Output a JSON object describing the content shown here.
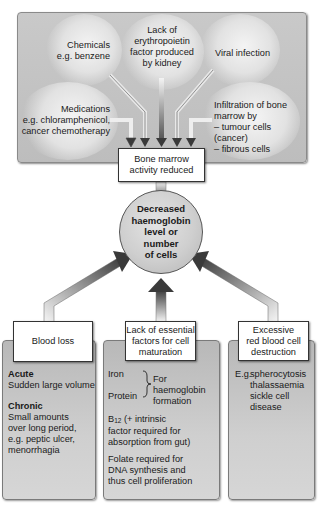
{
  "diagram": {
    "title_region": "Causes of bone marrow activity reduction",
    "causes_panel": {
      "items": [
        {
          "id": "chemicals",
          "text": "Chemicals\ne.g. benzene"
        },
        {
          "id": "erythropoietin",
          "text": "Lack of\nerythropoietin\nfactor produced\nby kidney"
        },
        {
          "id": "viral",
          "text": "Viral infection"
        },
        {
          "id": "medications",
          "text": "Medications\ne.g. chloramphenicol,\ncancer chemotherapy"
        },
        {
          "id": "infiltration",
          "text": "Infiltration of bone\nmarrow by\n– tumour cells (cancer)\n– fibrous cells"
        }
      ]
    },
    "bone_marrow_box": {
      "text": "Bone marrow\nactivity reduced"
    },
    "central_node": {
      "text": "Decreased\nhaemoglobin\nlevel or\nnumber\nof cells"
    },
    "bottom_boxes": [
      {
        "id": "blood-loss",
        "title": "Blood loss",
        "sections": [
          {
            "heading": "Acute",
            "body": "Sudden large volume"
          },
          {
            "heading": "Chronic",
            "body": "Small amounts\nover long period,\ne.g. peptic ulcer,\nmenorrhagia"
          }
        ]
      },
      {
        "id": "lack-factors",
        "title": "Lack of essential\nfactors for cell\nmaturation",
        "iron": "Iron",
        "protein": "Protein",
        "brace_label": "For haemoglobin\nformation",
        "b12_prefix": "B",
        "b12_sub": "12",
        "b12_rest": " (+ intrinsic\nfactor required for\nabsorption from gut)",
        "folate": "Folate required  for\nDNA synthesis and\nthus cell proliferation"
      },
      {
        "id": "rbc-destruction",
        "title": "Excessive\nred blood cell\ndestruction",
        "eg_label": "E.g.",
        "examples": "spherocytosis\nthalassaemia\nsickle cell\ndisease"
      }
    ],
    "colors": {
      "panel": "#c4c4c4",
      "card": "#c8c8c8",
      "arrow_dark": "#3a3a3a",
      "box_border": "#333333"
    }
  }
}
